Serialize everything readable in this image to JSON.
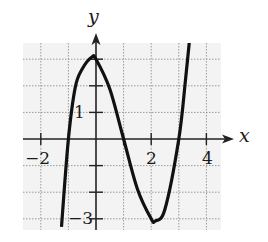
{
  "chart_data": {
    "type": "line",
    "title": "",
    "xlabel": "x",
    "ylabel": "y",
    "xlim": [
      -2.65,
      4.55
    ],
    "ylim": [
      -3.4,
      3.6
    ],
    "grid": true,
    "grid_style": "dotted",
    "x_tick_labels": [
      {
        "value": -2,
        "label": "−2"
      },
      {
        "value": 2,
        "label": "2"
      },
      {
        "value": 4,
        "label": "4"
      }
    ],
    "y_tick_labels": [
      {
        "value": 1,
        "label": "1"
      },
      {
        "value": -3,
        "label": "−3"
      }
    ],
    "x_ticks": [
      -2,
      -1,
      0,
      1,
      2,
      3,
      4
    ],
    "y_ticks": [
      -3,
      -2,
      -1,
      0,
      1,
      2,
      3
    ],
    "series": [
      {
        "name": "f(x)",
        "description": "cubic curve with local max near (-0.15, 3.1), local min near (2.15, -3.1), zeros near x = -1, 1, 3",
        "x": [
          -1.25,
          -1.0,
          -0.75,
          -0.5,
          -0.15,
          0.0,
          0.5,
          1.0,
          1.5,
          2.0,
          2.15,
          2.5,
          3.0,
          3.25,
          3.5
        ],
        "y": [
          -3.3,
          0.0,
          1.95,
          2.63,
          3.08,
          3.0,
          1.88,
          0.0,
          -1.88,
          -3.0,
          -3.08,
          -2.63,
          0.0,
          2.3,
          4.9
        ]
      }
    ],
    "annotations": []
  },
  "labels": {
    "x_axis": "x",
    "y_axis": "y",
    "tick_neg2": "−2",
    "tick_2": "2",
    "tick_4": "4",
    "tick_y1": "1",
    "tick_yneg3": "−3"
  },
  "colors": {
    "curve": "#111111",
    "axes": "#222222",
    "grid": "#9a9a9a",
    "grid_bg": "#f3f3f3",
    "background": "#ffffff"
  }
}
